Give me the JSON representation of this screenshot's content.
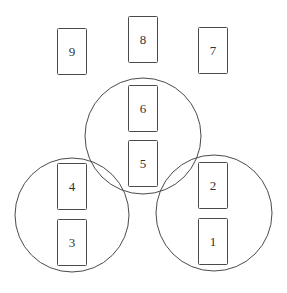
{
  "diagram": {
    "type": "card-spread-layout",
    "circles": [
      {
        "name": "top-center-circle",
        "cx": 143,
        "cy": 136,
        "r": 58
      },
      {
        "name": "bottom-left-circle",
        "cx": 72,
        "cy": 215,
        "r": 57
      },
      {
        "name": "bottom-right-circle",
        "cx": 214,
        "cy": 213,
        "r": 58
      }
    ],
    "cards": [
      {
        "label": "1",
        "x": 198,
        "y": 218
      },
      {
        "label": "2",
        "x": 198,
        "y": 162
      },
      {
        "label": "3",
        "x": 57,
        "y": 219
      },
      {
        "label": "4",
        "x": 57,
        "y": 163
      },
      {
        "label": "5",
        "x": 128,
        "y": 140
      },
      {
        "label": "6",
        "x": 128,
        "y": 85
      },
      {
        "label": "7",
        "x": 198,
        "y": 27
      },
      {
        "label": "8",
        "x": 128,
        "y": 16
      },
      {
        "label": "9",
        "x": 57,
        "y": 28
      }
    ],
    "stroke_color": "#4a4a4a"
  }
}
